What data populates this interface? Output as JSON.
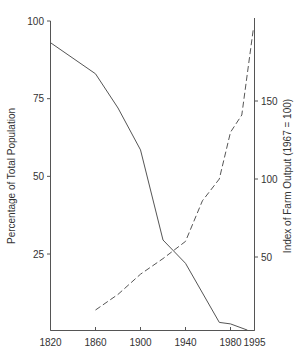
{
  "chart_data": {
    "type": "line",
    "title": "",
    "xlabel": "",
    "ylabel": "Percentage of Total Population",
    "ylabel_right": "Index of Farm Output (1967 = 100)",
    "x_ticks": [
      1820,
      1860,
      1900,
      1940,
      1980,
      1995
    ],
    "y_ticks_left": [
      25,
      50,
      75,
      100
    ],
    "y_ticks_right": [
      50,
      100,
      150
    ],
    "xlim": [
      1820,
      1995
    ],
    "ylim": [
      0,
      100
    ],
    "ylim_right": [
      0,
      200
    ],
    "grid": false,
    "legend": null,
    "series": [
      {
        "name": "Percentage of Total Population",
        "axis": "left",
        "style": "solid",
        "x": [
          1820,
          1860,
          1880,
          1900,
          1920,
          1940,
          1970,
          1980,
          1995
        ],
        "values": [
          93,
          83,
          72,
          58.5,
          29.5,
          22,
          3,
          2.5,
          0.5
        ]
      },
      {
        "name": "Index of Farm Output (1967 = 100)",
        "axis": "right",
        "style": "dashed",
        "x": [
          1860,
          1880,
          1900,
          1920,
          1940,
          1955,
          1970,
          1980,
          1990,
          1995
        ],
        "values": [
          16,
          26,
          39,
          49,
          60,
          86,
          100,
          130,
          141,
          197
        ]
      }
    ]
  },
  "labels": {
    "ylabel_left": "Percentage of Total Population",
    "ylabel_right": "Index of Farm Output (1967 = 100)"
  }
}
